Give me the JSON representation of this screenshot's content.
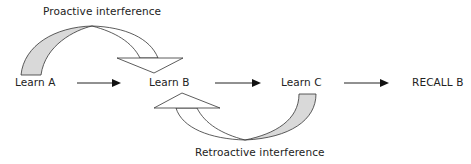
{
  "diagram": {
    "nodes": [
      {
        "id": "learn-a",
        "label": "Learn A"
      },
      {
        "id": "learn-b",
        "label": "Learn B"
      },
      {
        "id": "learn-c",
        "label": "Learn C"
      },
      {
        "id": "recall-b",
        "label": "RECALL B"
      }
    ],
    "edges": [
      {
        "from": "learn-a",
        "to": "learn-b"
      },
      {
        "from": "learn-b",
        "to": "learn-c"
      },
      {
        "from": "learn-c",
        "to": "recall-b"
      }
    ],
    "curved_arrows": [
      {
        "label": "Proactive interference",
        "from": "learn-a",
        "to": "learn-b"
      },
      {
        "label": "Retroactive interference",
        "from": "learn-c",
        "to": "learn-b"
      }
    ],
    "colors": {
      "arrow_fill_shaded": "#d9d9d9",
      "stroke": "#222222"
    }
  }
}
